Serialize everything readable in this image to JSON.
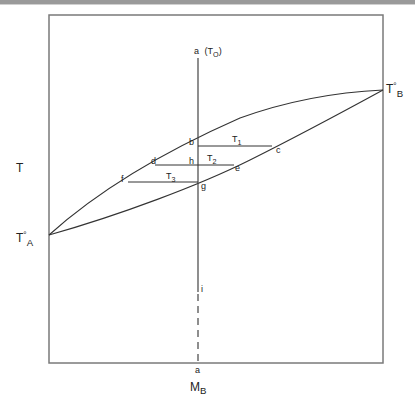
{
  "diagram": {
    "type": "binary phase diagram (lens-shaped liquidus/solidus)",
    "y_axis_label": "T",
    "x_axis_label": {
      "main": "M",
      "sub": "B"
    },
    "endpoints": {
      "left": {
        "main": "T",
        "sup": "°",
        "sub": "A"
      },
      "right": {
        "main": "T",
        "sup": "°",
        "sub": "B"
      }
    },
    "vertical_line": {
      "top_label": "a",
      "top_label_paren": "(T",
      "top_label_paren_sub": "O",
      "top_label_close": ")",
      "lower_label": "i",
      "bottom_label": "a"
    },
    "points": {
      "b": "b",
      "c": "c",
      "d": "d",
      "e": "e",
      "f": "f",
      "g": "g",
      "h": "h"
    },
    "tie_lines": [
      {
        "main": "T",
        "sub": "1"
      },
      {
        "main": "T",
        "sub": "2"
      },
      {
        "main": "T",
        "sub": "3"
      }
    ],
    "colors": {
      "line": "#333333",
      "frame": "#777777"
    }
  }
}
